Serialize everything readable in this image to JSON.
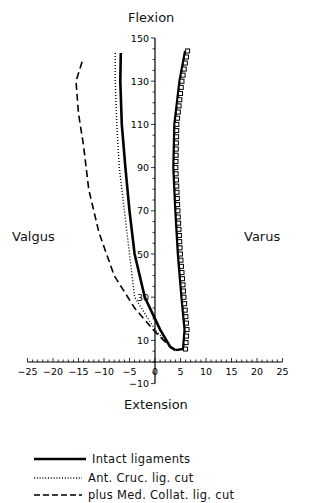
{
  "chart_data": {
    "type": "line",
    "title": "Flexion",
    "xlabel": "Extension",
    "left_label": "Valgus",
    "right_label": "Varus",
    "xlim": [
      -25,
      25
    ],
    "ylim": [
      -10,
      150
    ],
    "x_ticks": [
      -25,
      -20,
      -15,
      -10,
      -5,
      0,
      5,
      10,
      15,
      20,
      25
    ],
    "y_ticks": [
      -10,
      10,
      30,
      50,
      70,
      90,
      110,
      130,
      150
    ],
    "grid": false,
    "legend_position": "bottom",
    "series": [
      {
        "name": "Intact ligaments",
        "style": "solid",
        "points_left": [
          [
            -6.7,
            143
          ],
          [
            -6.8,
            130
          ],
          [
            -6.5,
            110
          ],
          [
            -5.8,
            90
          ],
          [
            -5,
            70
          ],
          [
            -4,
            50
          ],
          [
            -2,
            30
          ],
          [
            1,
            15
          ],
          [
            3,
            7
          ],
          [
            4,
            5.5
          ]
        ],
        "points_right": [
          [
            5.9,
            144
          ],
          [
            4.8,
            130
          ],
          [
            3.8,
            110
          ],
          [
            3.6,
            90
          ],
          [
            4,
            70
          ],
          [
            4.5,
            50
          ],
          [
            5.2,
            30
          ],
          [
            5.8,
            15
          ],
          [
            5.5,
            6
          ],
          [
            4,
            5.5
          ]
        ]
      },
      {
        "name": "Ant. Cruc. lig. cut",
        "style": "dotted",
        "points": [
          [
            -7.8,
            143
          ],
          [
            -7.8,
            130
          ],
          [
            -7.5,
            110
          ],
          [
            -7,
            90
          ],
          [
            -6,
            70
          ],
          [
            -5,
            50
          ],
          [
            -4,
            30
          ],
          [
            0,
            15
          ],
          [
            3,
            7
          ]
        ]
      },
      {
        "name": "plus Med. Collat. lig. cut",
        "style": "dashed",
        "points": [
          [
            -14.3,
            139
          ],
          [
            -15.5,
            130
          ],
          [
            -15,
            115
          ],
          [
            -14,
            100
          ],
          [
            -13,
            80
          ],
          [
            -11,
            60
          ],
          [
            -8,
            40
          ],
          [
            -4,
            25
          ],
          [
            0,
            14
          ],
          [
            3,
            7
          ]
        ]
      }
    ]
  },
  "labels": {
    "title": "Flexion",
    "xtitle": "Extension",
    "valgus": "Valgus",
    "varus": "Varus"
  },
  "legend": [
    {
      "label": "Intact ligaments"
    },
    {
      "label": "Ant. Cruc. lig. cut"
    },
    {
      "label": "plus Med. Collat. lig. cut"
    }
  ]
}
